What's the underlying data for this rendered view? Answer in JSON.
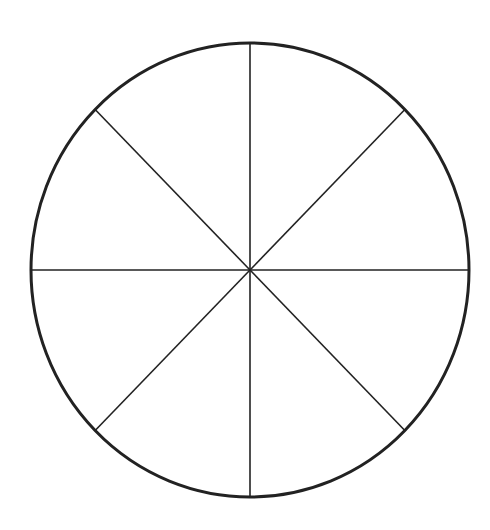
{
  "diagram": {
    "type": "circle-divided-into-sectors",
    "sector_count": 8,
    "center": {
      "x": 250,
      "y": 270
    },
    "radius_x": 219,
    "radius_y": 227,
    "stroke_color": "#222222",
    "background_color": "#ffffff"
  }
}
